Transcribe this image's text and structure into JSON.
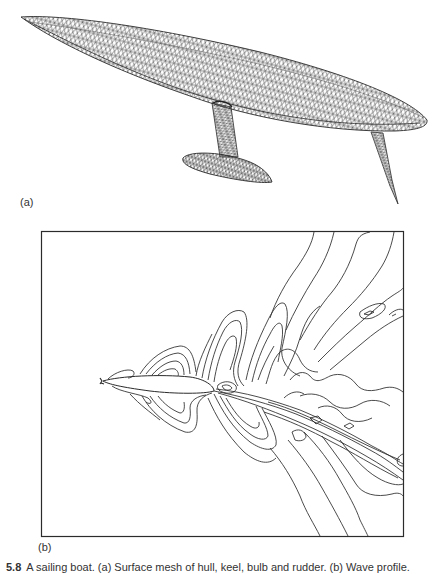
{
  "figure": {
    "panels": [
      {
        "id": "a",
        "label": "(a)",
        "description": "Surface mesh of hull, keel, bulb and rudder",
        "components": [
          "hull",
          "keel",
          "bulb",
          "rudder"
        ]
      },
      {
        "id": "b",
        "label": "(b)",
        "description": "Wave profile contour plot around the hull"
      }
    ],
    "caption": {
      "number": "5.8",
      "text": "A sailing boat. (a) Surface mesh of hull, keel, bulb and rudder. (b) Wave profile."
    },
    "colors": {
      "line": "#2b2b2b",
      "mesh": "#3a3a3a",
      "background": "#ffffff"
    }
  }
}
